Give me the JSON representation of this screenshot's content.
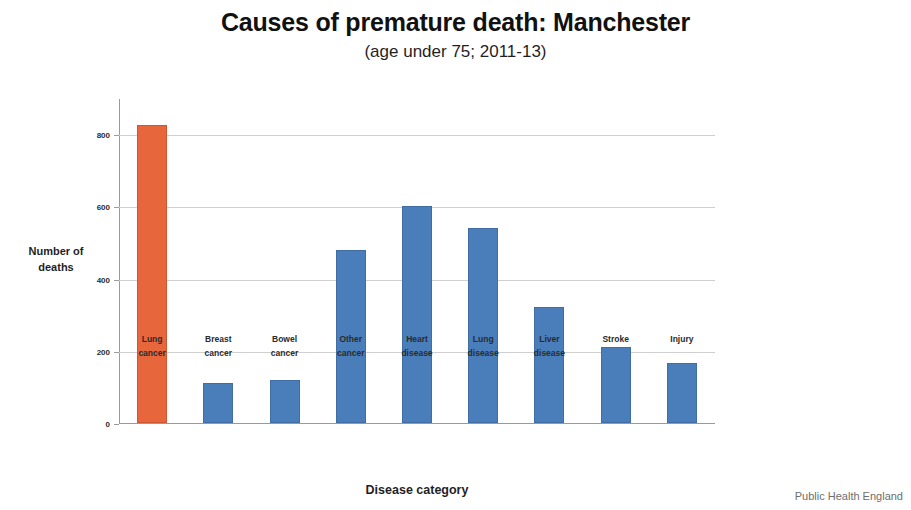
{
  "chart_data": {
    "type": "bar",
    "title": "Causes of premature death: Manchester",
    "subtitle": "(age under 75; 2011-13)",
    "xlabel": "Disease category",
    "ylabel": "Number of deaths",
    "categories": [
      "Lung cancer",
      "Breast cancer",
      "Bowel cancer",
      "Other cancer",
      "Heart disease",
      "Lung disease",
      "Liver disease",
      "Stroke",
      "Injury"
    ],
    "category_lines": [
      [
        "Lung",
        "cancer"
      ],
      [
        "Breast",
        "cancer"
      ],
      [
        "Bowel",
        "cancer"
      ],
      [
        "Other",
        "cancer"
      ],
      [
        "Heart",
        "disease"
      ],
      [
        "Lung",
        "disease"
      ],
      [
        "Liver",
        "disease"
      ],
      [
        "Stroke",
        ""
      ],
      [
        "Injury",
        ""
      ]
    ],
    "values": [
      825,
      110,
      120,
      480,
      600,
      540,
      320,
      210,
      165
    ],
    "bar_colors": [
      "#e8663c",
      "#4a7ebb",
      "#4a7ebb",
      "#4a7ebb",
      "#4a7ebb",
      "#4a7ebb",
      "#4a7ebb",
      "#4a7ebb",
      "#4a7ebb"
    ],
    "highlight_index": 0,
    "ylim": [
      0,
      900
    ],
    "yticks": [
      0,
      200,
      400,
      600,
      800
    ],
    "ytick_labels": [
      "0",
      "200",
      "400",
      "600",
      "800"
    ],
    "grid": true,
    "grid_axis": "y",
    "legend": false
  },
  "footer": {
    "source": "Public Health England"
  },
  "colors": {
    "highlight": "#e8663c",
    "series": "#4a7ebb",
    "gridline": "#cfcfcf",
    "axis": "#9a9a9a"
  }
}
